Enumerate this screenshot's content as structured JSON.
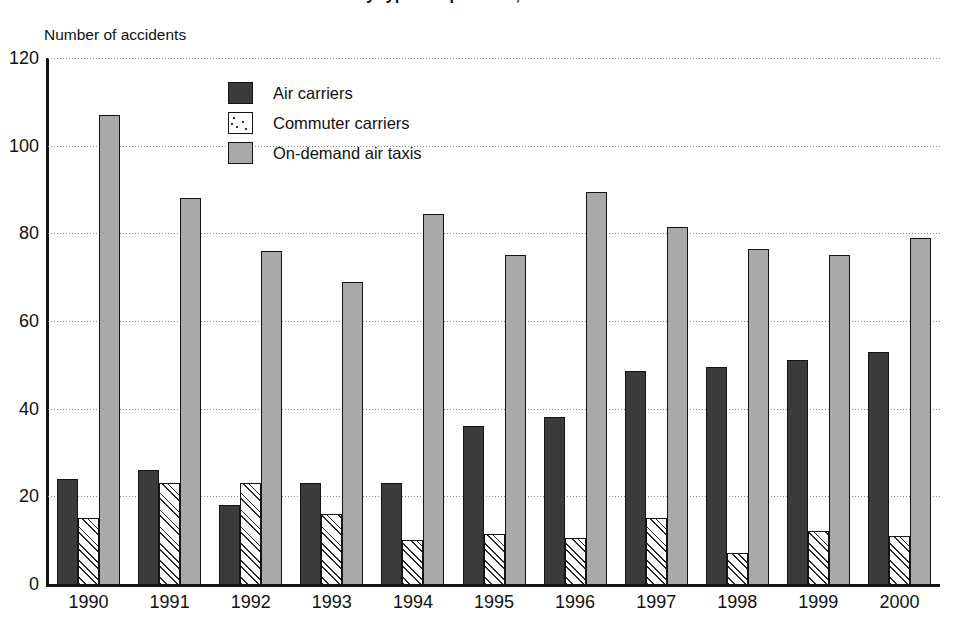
{
  "title": "Accidents and accident rates by type of operation, 1990-2000",
  "axis_title": "Number of accidents",
  "legend": [
    {
      "label": "Air carriers",
      "color": "#3b3b3b",
      "pattern": "solid-dark"
    },
    {
      "label": "Commuter carriers",
      "color": "#ffffff",
      "pattern": "diagonal-dotted-hatch"
    },
    {
      "label": "On-demand air taxis",
      "color": "#a9a9a9",
      "pattern": "solid-gray"
    }
  ],
  "chart_data": {
    "type": "bar",
    "title": "Accidents and accident rates by type of operation, 1990-2000",
    "xlabel": "",
    "ylabel": "Number of accidents",
    "ylim": [
      0,
      120
    ],
    "yticks": [
      0,
      20,
      40,
      60,
      80,
      100,
      120
    ],
    "grid": true,
    "legend_position": "inside-top-left",
    "categories": [
      "1990",
      "1991",
      "1992",
      "1993",
      "1994",
      "1995",
      "1996",
      "1997",
      "1998",
      "1999",
      "2000"
    ],
    "series": [
      {
        "name": "Air carriers",
        "color": "#3b3b3b",
        "values": [
          24,
          26,
          18,
          23,
          23,
          36,
          38,
          48.5,
          49.5,
          51,
          53
        ]
      },
      {
        "name": "Commuter carriers",
        "color": "#ffffff",
        "values": [
          15,
          23,
          23,
          16,
          10,
          11.5,
          10.5,
          15,
          7,
          12,
          11
        ]
      },
      {
        "name": "On-demand air taxis",
        "color": "#a9a9a9",
        "values": [
          107,
          88,
          76,
          69,
          84.5,
          75,
          89.5,
          81.5,
          76.5,
          75,
          79
        ]
      }
    ]
  }
}
